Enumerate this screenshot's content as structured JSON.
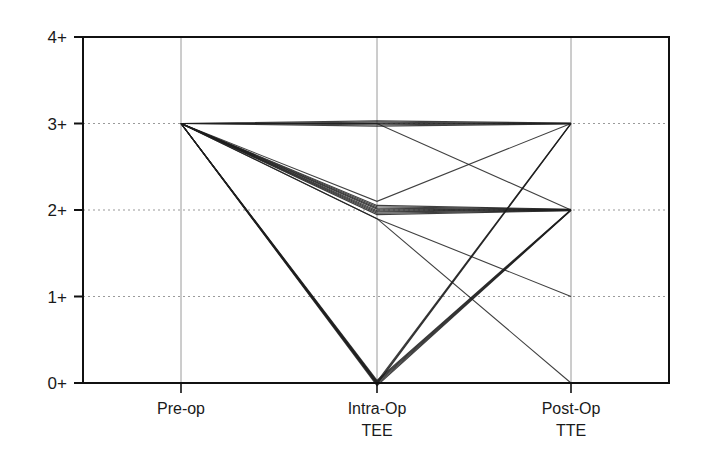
{
  "chart_data": {
    "type": "line",
    "title": "",
    "xlabel": "",
    "ylabel": "",
    "categories": [
      "Pre-op",
      "Intra-Op TEE",
      "Post-Op TTE"
    ],
    "x_tick_labels": [
      {
        "line1": "Pre-op",
        "line2": ""
      },
      {
        "line1": "Intra-Op",
        "line2": "TEE"
      },
      {
        "line1": "Post-Op",
        "line2": "TTE"
      }
    ],
    "y_tick_labels": [
      "0+",
      "1+",
      "2+",
      "3+",
      "4+"
    ],
    "ylim": [
      0,
      4
    ],
    "grid": {
      "horizontal_dotted": true,
      "vertical_solid_light": true
    },
    "legend": null,
    "series_description": "Each line is one patient's regurgitation grade across Pre-op, Intra-Op TEE and Post-Op TTE; lines are slightly jittered in the original.",
    "series": [
      {
        "name": "3 → 3 → 3",
        "count": 5,
        "values": [
          3,
          3,
          3
        ]
      },
      {
        "name": "3 → 3 → 2",
        "count": 1,
        "values": [
          3,
          3,
          2
        ]
      },
      {
        "name": "3 → 2 → 3",
        "count": 1,
        "values": [
          3,
          2.1,
          3
        ]
      },
      {
        "name": "3 → 2 → 2",
        "count": 8,
        "values": [
          3,
          2,
          2
        ]
      },
      {
        "name": "3 → 2 → 1",
        "count": 1,
        "values": [
          3,
          1.9,
          1
        ]
      },
      {
        "name": "3 → 2 → 0",
        "count": 1,
        "values": [
          3,
          1.9,
          0
        ]
      },
      {
        "name": "3 → 0 → 3",
        "count": 3,
        "values": [
          3,
          0,
          3
        ]
      },
      {
        "name": "3 → 0 → 2",
        "count": 5,
        "values": [
          3,
          0,
          2
        ]
      }
    ]
  },
  "colors": {
    "line": "#1e1e1e",
    "axis": "#111111",
    "grid": "#9a9a9a",
    "background": "#ffffff"
  }
}
